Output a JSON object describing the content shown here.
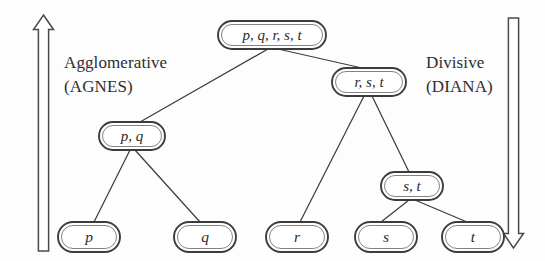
{
  "figure": {
    "background_color": "#fdfdfd",
    "stroke_color": "#3c3c3c",
    "text_color": "#2b2b2b"
  },
  "annotations": {
    "left": {
      "line1": "Agglomerative",
      "line2": "(AGNES)",
      "arrow_direction": "up",
      "arrow_icon": "arrow-up-icon"
    },
    "right": {
      "line1": "Divisive",
      "line2": "(DIANA)",
      "arrow_direction": "down",
      "arrow_icon": "arrow-down-icon"
    }
  },
  "tree": {
    "nodes": [
      {
        "id": "root",
        "label": "p, q, r, s, t",
        "cx": 272,
        "cy": 35,
        "w": 108,
        "h": 28,
        "level": 0
      },
      {
        "id": "rst",
        "label": "r, s, t",
        "cx": 369,
        "cy": 82,
        "w": 74,
        "h": 28,
        "level": 1
      },
      {
        "id": "pq",
        "label": "p, q",
        "cx": 132,
        "cy": 136,
        "w": 66,
        "h": 28,
        "level": 2
      },
      {
        "id": "st",
        "label": "s, t",
        "cx": 412,
        "cy": 186,
        "w": 62,
        "h": 28,
        "level": 3
      },
      {
        "id": "leaf_p",
        "label": "p",
        "cx": 89,
        "cy": 237,
        "w": 62,
        "h": 30,
        "level": 4
      },
      {
        "id": "leaf_q",
        "label": "q",
        "cx": 205,
        "cy": 237,
        "w": 62,
        "h": 30,
        "level": 4
      },
      {
        "id": "leaf_r",
        "label": "r",
        "cx": 297,
        "cy": 237,
        "w": 62,
        "h": 30,
        "level": 4
      },
      {
        "id": "leaf_s",
        "label": "s",
        "cx": 386,
        "cy": 237,
        "w": 62,
        "h": 30,
        "level": 4
      },
      {
        "id": "leaf_t",
        "label": "t",
        "cx": 473,
        "cy": 237,
        "w": 62,
        "h": 30,
        "level": 4
      }
    ],
    "edges": [
      {
        "from": "root",
        "to": "pq"
      },
      {
        "from": "root",
        "to": "rst"
      },
      {
        "from": "rst",
        "to": "leaf_r"
      },
      {
        "from": "rst",
        "to": "st"
      },
      {
        "from": "pq",
        "to": "leaf_p"
      },
      {
        "from": "pq",
        "to": "leaf_q"
      },
      {
        "from": "st",
        "to": "leaf_s"
      },
      {
        "from": "st",
        "to": "leaf_t"
      }
    ]
  }
}
